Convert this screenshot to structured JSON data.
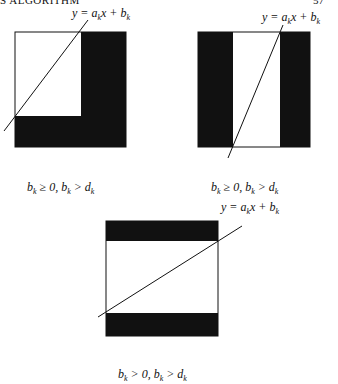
{
  "header": {
    "running_title": "S ALGORITHM",
    "page_number": "57"
  },
  "figures": [
    {
      "id": "fig-a",
      "line_label": {
        "y": "y",
        "eq": " = a",
        "k": "k",
        "x": "x + b",
        "k2": "k"
      },
      "caption": {
        "b1": "b",
        "k1": "k",
        "mid": " ≥ 0, b",
        "k2": "k",
        "gt": " > d",
        "k3": "k"
      },
      "shape": "L-shape: right column and bottom band black"
    },
    {
      "id": "fig-b",
      "line_label": {
        "y": "y",
        "eq": " = a",
        "k": "k",
        "x": "x + b",
        "k2": "k"
      },
      "caption": {
        "b1": "b",
        "k1": "k",
        "mid": " ≥ 0, b",
        "k2": "k",
        "gt": " > d",
        "k3": "k"
      },
      "shape": "left and right columns black"
    },
    {
      "id": "fig-c",
      "line_label": {
        "y": "y",
        "eq": " = a",
        "k": "k",
        "x": "x + b",
        "k2": "k"
      },
      "caption": {
        "b1": "b",
        "k1": "k",
        "mid": " > 0, b",
        "k2": "k",
        "gt": " > d",
        "k3": "k"
      },
      "shape": "top and bottom bands black"
    }
  ],
  "colors": {
    "ink": "#111111",
    "paper": "#ffffff"
  }
}
